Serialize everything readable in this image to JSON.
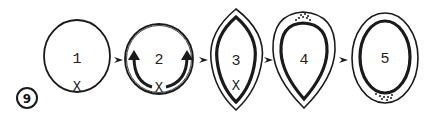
{
  "figure": {
    "badge": "9",
    "stages": [
      {
        "label": "1",
        "marker": "X",
        "shape": "circle"
      },
      {
        "label": "2",
        "marker": "X",
        "shape": "circle-with-arrows"
      },
      {
        "label": "3",
        "marker": "X",
        "shape": "lens-double-outline"
      },
      {
        "label": "4",
        "marker": "",
        "shape": "teardrop-double-outline-dots-top"
      },
      {
        "label": "5",
        "marker": "",
        "shape": "oval-double-outline-dots-bottom"
      }
    ],
    "arrow_glyph": "arrowhead-right",
    "colors": {
      "ink": "#1a1a1a",
      "background": "#ffffff"
    }
  }
}
